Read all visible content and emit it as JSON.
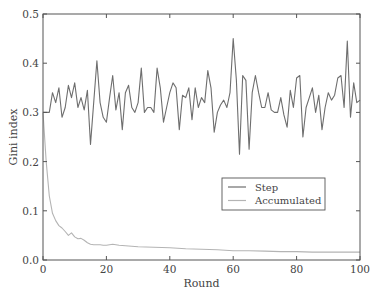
{
  "chart_data": {
    "type": "line",
    "title": "",
    "xlabel": "Round",
    "ylabel": "Gini index",
    "xlim": [
      0,
      100
    ],
    "ylim": [
      0.0,
      0.5
    ],
    "xticks": [
      0,
      20,
      40,
      60,
      80,
      100
    ],
    "xtick_labels": [
      "0",
      "20",
      "40",
      "60",
      "80",
      "100"
    ],
    "yticks": [
      0.0,
      0.1,
      0.2,
      0.3,
      0.4,
      0.5
    ],
    "ytick_labels": [
      "0.0",
      "0.1",
      "0.2",
      "0.3",
      "0.4",
      "0.5"
    ],
    "grid": false,
    "legend_position": "lower right (inside plot)",
    "legend": [
      "Step",
      "Accumulated"
    ],
    "series": [
      {
        "name": "Step",
        "color": "#6e6e6e",
        "x": [
          0,
          1,
          2,
          3,
          4,
          5,
          6,
          7,
          8,
          9,
          10,
          11,
          12,
          13,
          14,
          15,
          16,
          17,
          18,
          19,
          20,
          21,
          22,
          23,
          24,
          25,
          26,
          27,
          28,
          29,
          30,
          31,
          32,
          33,
          34,
          35,
          36,
          37,
          38,
          39,
          40,
          41,
          42,
          43,
          44,
          45,
          46,
          47,
          48,
          49,
          50,
          51,
          52,
          53,
          54,
          55,
          56,
          57,
          58,
          59,
          60,
          61,
          62,
          63,
          64,
          65,
          66,
          67,
          68,
          69,
          70,
          71,
          72,
          73,
          74,
          75,
          76,
          77,
          78,
          79,
          80,
          81,
          82,
          83,
          84,
          85,
          86,
          87,
          88,
          89,
          90,
          91,
          92,
          93,
          94,
          95,
          96,
          97,
          98,
          99,
          100
        ],
        "values": [
          0.3,
          0.3,
          0.3,
          0.34,
          0.32,
          0.35,
          0.29,
          0.31,
          0.355,
          0.33,
          0.36,
          0.31,
          0.33,
          0.305,
          0.345,
          0.235,
          0.32,
          0.405,
          0.32,
          0.29,
          0.28,
          0.33,
          0.375,
          0.305,
          0.34,
          0.265,
          0.34,
          0.355,
          0.31,
          0.3,
          0.32,
          0.39,
          0.3,
          0.31,
          0.31,
          0.3,
          0.39,
          0.35,
          0.28,
          0.31,
          0.34,
          0.36,
          0.35,
          0.265,
          0.335,
          0.33,
          0.35,
          0.285,
          0.35,
          0.31,
          0.33,
          0.32,
          0.385,
          0.35,
          0.26,
          0.3,
          0.315,
          0.325,
          0.31,
          0.34,
          0.45,
          0.365,
          0.215,
          0.375,
          0.365,
          0.225,
          0.34,
          0.375,
          0.34,
          0.31,
          0.31,
          0.34,
          0.305,
          0.3,
          0.3,
          0.33,
          0.295,
          0.27,
          0.345,
          0.31,
          0.37,
          0.375,
          0.25,
          0.31,
          0.33,
          0.35,
          0.3,
          0.335,
          0.265,
          0.31,
          0.34,
          0.325,
          0.335,
          0.37,
          0.375,
          0.31,
          0.445,
          0.29,
          0.36,
          0.32,
          0.325
        ]
      },
      {
        "name": "Accumulated",
        "color": "#b4b4b4",
        "x": [
          0,
          1,
          2,
          3,
          4,
          5,
          6,
          7,
          8,
          9,
          10,
          11,
          12,
          13,
          14,
          15,
          16,
          17,
          18,
          19,
          20,
          22,
          24,
          26,
          28,
          30,
          35,
          40,
          45,
          50,
          55,
          60,
          65,
          70,
          75,
          80,
          85,
          90,
          95,
          100
        ],
        "values": [
          0.3,
          0.2,
          0.13,
          0.095,
          0.08,
          0.07,
          0.065,
          0.058,
          0.05,
          0.055,
          0.047,
          0.043,
          0.044,
          0.04,
          0.035,
          0.032,
          0.031,
          0.031,
          0.031,
          0.03,
          0.03,
          0.032,
          0.03,
          0.029,
          0.028,
          0.027,
          0.026,
          0.025,
          0.023,
          0.022,
          0.021,
          0.019,
          0.019,
          0.018,
          0.017,
          0.017,
          0.016,
          0.016,
          0.016,
          0.016
        ]
      }
    ]
  },
  "plot_area": {
    "left": 43,
    "top": 14,
    "right": 360,
    "bottom": 260
  },
  "legend_box": {
    "x": 222,
    "y": 178,
    "w": 103,
    "h": 32
  }
}
